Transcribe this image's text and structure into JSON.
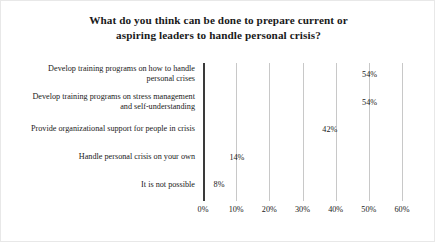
{
  "chart_data": {
    "type": "bar",
    "orientation": "horizontal",
    "title": "What do you think can be done to prepare current or aspiring leaders to handle personal crisis?",
    "title_lines": [
      "What do you think can be done to prepare current or",
      "aspiring leaders to handle personal crisis?"
    ],
    "categories": [
      "Develop training programs on how to handle\npersonal crises",
      "Develop training programs on stress management\nand self-understanding",
      "Provide organizational support for people in crisis",
      "Handle personal crisis on your own",
      "It is not possible"
    ],
    "values": [
      54,
      54,
      42,
      14,
      8
    ],
    "value_labels": [
      "54%",
      "54%",
      "42%",
      "14%",
      "8%"
    ],
    "xlabel": "",
    "ylabel": "",
    "xlim": [
      0,
      60
    ],
    "xticks": [
      0,
      10,
      20,
      30,
      40,
      50,
      60
    ],
    "xtick_labels": [
      "0%",
      "10%",
      "20%",
      "30%",
      "40%",
      "50%",
      "60%"
    ],
    "grid": "vertical",
    "legend": "none",
    "colors": {
      "bar_fill": "#d2d2d2",
      "gridline": "#c8c8c8",
      "axis_line": "#3a3a3a",
      "text": "#1a1a1a",
      "background": "#ffffff",
      "frame": "#e8e8e8"
    }
  }
}
